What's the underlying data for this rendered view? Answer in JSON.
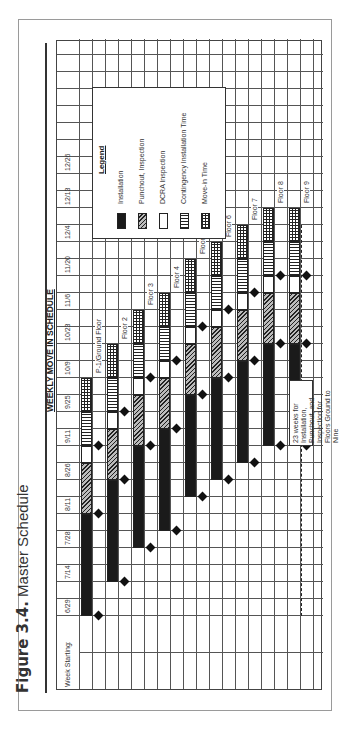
{
  "figure": {
    "number": "Figure 3.4.",
    "title": "Master Schedule"
  },
  "chart_data": {
    "type": "gantt",
    "title": "WEEKLY MOVE IN SCHEDULE",
    "xlabel": "Week Starting:",
    "week_labels": [
      "6/29",
      "7/14",
      "7/28",
      "8/11",
      "8/26",
      "9/11",
      "9/25",
      "10/9",
      "10/23",
      "11/6",
      "11/20",
      "12/4",
      "12/13",
      "12/26"
    ],
    "unit": "weeks from 6/29",
    "phases": [
      "Installation",
      "Punchout, Inspection",
      "DCRA Inspection",
      "Contingency Installation Time",
      "Move-in Time"
    ],
    "floors": [
      {
        "name": "P-1/Ground Floor",
        "installation": [
          0,
          6
        ],
        "punchout_inspection": [
          6,
          9
        ],
        "dcra_inspection": [
          9,
          10
        ],
        "contingency": [
          10,
          12
        ],
        "move_in": [
          12,
          14
        ],
        "milestones": [
          0,
          6,
          10
        ]
      },
      {
        "name": "Floor 2",
        "installation": [
          2,
          8
        ],
        "punchout_inspection": [
          8,
          11
        ],
        "dcra_inspection": [
          11,
          12
        ],
        "contingency": [
          12,
          14
        ],
        "move_in": [
          14,
          16
        ],
        "milestones": [
          2,
          8,
          12
        ]
      },
      {
        "name": "Floor 3",
        "installation": [
          4,
          10
        ],
        "punchout_inspection": [
          10,
          13
        ],
        "dcra_inspection": [
          13,
          14
        ],
        "contingency": [
          14,
          16
        ],
        "move_in": [
          16,
          18
        ],
        "milestones": [
          4,
          10,
          14
        ]
      },
      {
        "name": "Floor 4",
        "installation": [
          5,
          11
        ],
        "punchout_inspection": [
          11,
          14
        ],
        "dcra_inspection": [
          14,
          15
        ],
        "contingency": [
          15,
          17
        ],
        "move_in": [
          17,
          19
        ],
        "milestones": [
          5,
          11,
          15
        ]
      },
      {
        "name": "Floor 5",
        "installation": [
          7,
          13
        ],
        "punchout_inspection": [
          13,
          16
        ],
        "dcra_inspection": [
          16,
          17
        ],
        "contingency": [
          17,
          19
        ],
        "move_in": [
          19,
          21
        ],
        "milestones": [
          7,
          13,
          17
        ]
      },
      {
        "name": "Floor 6",
        "installation": [
          8,
          14
        ],
        "punchout_inspection": [
          14,
          17
        ],
        "dcra_inspection": [
          17,
          18
        ],
        "contingency": [
          18,
          20
        ],
        "move_in": [
          20,
          22
        ],
        "milestones": [
          8,
          14,
          18
        ]
      },
      {
        "name": "Floor 7",
        "installation": [
          9,
          15
        ],
        "punchout_inspection": [
          15,
          18
        ],
        "dcra_inspection": [
          18,
          19
        ],
        "contingency": [
          19,
          21
        ],
        "move_in": [
          21,
          23
        ],
        "milestones": [
          9,
          15,
          19
        ]
      },
      {
        "name": "Floor 8",
        "installation": [
          10,
          16
        ],
        "punchout_inspection": [
          16,
          19
        ],
        "dcra_inspection": [
          19,
          20
        ],
        "contingency": [
          20,
          22
        ],
        "move_in": [
          22,
          24
        ],
        "milestones": [
          10,
          16,
          20
        ]
      },
      {
        "name": "Floor 9",
        "installation": [
          10,
          16
        ],
        "punchout_inspection": [
          16,
          19
        ],
        "dcra_inspection": [
          19,
          20
        ],
        "contingency": [
          20,
          22
        ],
        "move_in": [
          22,
          24
        ],
        "milestones": [
          10,
          16,
          20
        ]
      }
    ],
    "annotation": "23 weeks for Installation, Punchout, and Inspection for Floors Ground to Nine",
    "annotation_span_weeks": [
      0,
      23
    ],
    "legend_position": "upper right",
    "grid": true,
    "orientation": "rotated 90° counter-clockwise on page"
  },
  "legend": {
    "title": "Legend",
    "items": [
      {
        "label": "Installation",
        "style": "install"
      },
      {
        "label": "Punchout, Inspection",
        "style": "punch"
      },
      {
        "label": "DCRA Inspection",
        "style": "dcra"
      },
      {
        "label": "Contingency Installation Time",
        "style": "cont"
      },
      {
        "label": "Move-in Time",
        "style": "move"
      }
    ]
  }
}
